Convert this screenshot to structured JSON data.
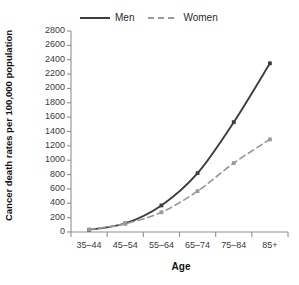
{
  "chart_data": {
    "type": "line",
    "title": "",
    "xlabel": "Age",
    "ylabel": "Cancer death rates per 100,000 population",
    "categories": [
      "35–44",
      "45–54",
      "55–64",
      "65–74",
      "75–84",
      "85+"
    ],
    "series": [
      {
        "name": "Men",
        "values": [
          30,
          120,
          370,
          820,
          1530,
          2350
        ],
        "style": "solid",
        "color": "#3d3d3d",
        "marker": "square"
      },
      {
        "name": "Women",
        "values": [
          35,
          115,
          275,
          570,
          960,
          1290
        ],
        "style": "dashed",
        "color": "#9a9a9a",
        "marker": "square"
      }
    ],
    "ylim": [
      0,
      2800
    ],
    "yticks": [
      0,
      200,
      400,
      600,
      800,
      1000,
      1200,
      1400,
      1600,
      1800,
      2000,
      2200,
      2400,
      2600,
      2800
    ],
    "ytick_labels": [
      "0",
      "200",
      "400",
      "600",
      "800",
      "1000",
      "1200",
      "1400",
      "1600",
      "1800",
      "2000",
      "2200",
      "2400",
      "2600",
      "2800"
    ],
    "grid": false,
    "legend_position": "top"
  },
  "legend": {
    "entries": [
      {
        "label": "Men"
      },
      {
        "label": "Women"
      }
    ]
  },
  "axes": {
    "y_title": "Cancer death rates per 100,000 population",
    "x_title": "Age"
  }
}
